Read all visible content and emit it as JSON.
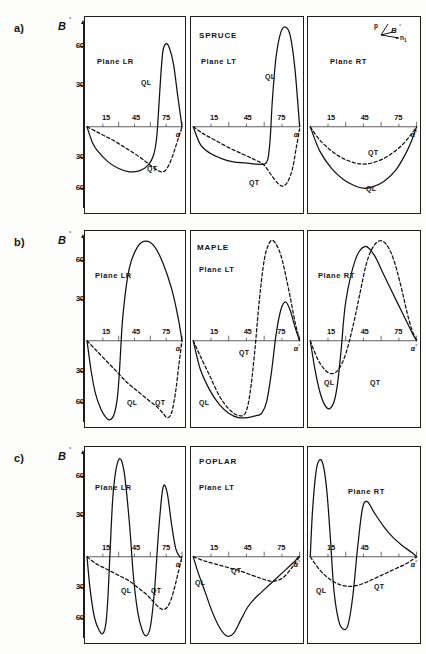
{
  "figure": {
    "axis": {
      "ylabel": "B",
      "ylabel_degree": "°",
      "yticks_positive": [
        "60",
        "30"
      ],
      "yticks_negative": [
        "30",
        "60"
      ],
      "xticks": [
        "15",
        "45",
        "75"
      ],
      "xlabel": "α",
      "xlabel_degree": "°"
    },
    "inset": {
      "p_label": "p",
      "beta_label": "B",
      "beta_degree": "°",
      "n_label": "n",
      "n_sub": "1"
    },
    "curve_labels": {
      "ql": "QL",
      "qt": "QT"
    },
    "rows": [
      {
        "tag": "a)",
        "species": "SPRUCE",
        "panels": [
          {
            "plane": "Plane LR",
            "ql_label": "QL",
            "qt_label": "QT"
          },
          {
            "plane": "Plane LT",
            "ql_label": "QL",
            "qt_label": "QT"
          },
          {
            "plane": "Plane RT",
            "ql_label": "QL",
            "qt_label": "QT"
          }
        ]
      },
      {
        "tag": "b)",
        "species": "MAPLE",
        "panels": [
          {
            "plane": "Plane  LR",
            "ql_label": "QL",
            "qt_label": "QT"
          },
          {
            "plane": "Plane LT",
            "ql_label": "QL",
            "qt_label": "QT"
          },
          {
            "plane": "Plane  RT",
            "ql_label": "QL",
            "qt_label": "QT"
          }
        ]
      },
      {
        "tag": "c)",
        "species": "POPLAR",
        "panels": [
          {
            "plane": "Plane    LR",
            "ql_label": "QL",
            "qt_label": "QT"
          },
          {
            "plane": "Plane  LT",
            "ql_label": "QL",
            "qt_label": "QT"
          },
          {
            "plane": "Plane  RT",
            "ql_label": "QL",
            "qt_label": "QT"
          }
        ]
      }
    ]
  },
  "chart_data": {
    "type": "line",
    "xlabel": "α°",
    "ylabel": "β°",
    "xlim": [
      0,
      90
    ],
    "ylim": [
      -75,
      75
    ],
    "xticks": [
      15,
      45,
      75
    ],
    "yticks": [
      -60,
      -30,
      0,
      30,
      60
    ],
    "grid": false,
    "legend": "inline curve labels QL (solid) and QT (dashed)",
    "series_styles": {
      "QL": "solid",
      "QT": "dashed"
    },
    "panels": [
      {
        "row": "a)",
        "species": "SPRUCE",
        "plane": "LR",
        "series": [
          {
            "name": "QL",
            "style": "solid",
            "x": [
              0,
              5,
              10,
              20,
              30,
              40,
              50,
              58,
              63,
              66,
              68,
              70,
              72,
              75,
              78,
              82,
              86,
              90
            ],
            "y": [
              0,
              -14,
              -22,
              -32,
              -38,
              -41,
              -40,
              -35,
              -26,
              -10,
              14,
              38,
              55,
              60,
              57,
              45,
              22,
              0
            ]
          },
          {
            "name": "QT",
            "style": "dashed",
            "x": [
              0,
              8,
              16,
              26,
              36,
              46,
              56,
              64,
              70,
              74,
              78,
              82,
              86,
              90
            ],
            "y": [
              0,
              -4,
              -8,
              -13,
              -19,
              -25,
              -32,
              -38,
              -41,
              -40,
              -34,
              -24,
              -12,
              0
            ]
          }
        ]
      },
      {
        "row": "a)",
        "species": "SPRUCE",
        "plane": "LT",
        "series": [
          {
            "name": "QL",
            "style": "solid",
            "x": [
              0,
              6,
              14,
              24,
              34,
              44,
              54,
              60,
              63,
              65,
              67,
              70,
              74,
              78,
              82,
              86,
              90
            ],
            "y": [
              0,
              -16,
              -24,
              -29,
              -32,
              -33,
              -34,
              -34,
              -30,
              -12,
              20,
              50,
              68,
              72,
              66,
              42,
              0
            ]
          },
          {
            "name": "QT",
            "style": "dashed",
            "x": [
              0,
              8,
              18,
              30,
              42,
              52,
              60,
              66,
              72,
              76,
              80,
              84,
              87,
              90
            ],
            "y": [
              0,
              -6,
              -12,
              -19,
              -25,
              -30,
              -35,
              -44,
              -52,
              -54,
              -50,
              -38,
              -20,
              -2
            ]
          }
        ]
      },
      {
        "row": "a)",
        "species": "SPRUCE",
        "plane": "RT",
        "series": [
          {
            "name": "QL",
            "style": "solid",
            "x": [
              0,
              8,
              18,
              28,
              38,
              45,
              52,
              62,
              72,
              80,
              86,
              90
            ],
            "y": [
              0,
              -22,
              -38,
              -48,
              -54,
              -56,
              -55,
              -50,
              -40,
              -26,
              -12,
              0
            ]
          },
          {
            "name": "QT",
            "style": "dashed",
            "x": [
              0,
              8,
              18,
              28,
              38,
              45,
              52,
              62,
              72,
              80,
              86,
              90
            ],
            "y": [
              0,
              -12,
              -22,
              -29,
              -33,
              -34,
              -33,
              -29,
              -22,
              -14,
              -6,
              0
            ]
          }
        ]
      },
      {
        "row": "b)",
        "species": "MAPLE",
        "plane": "LR",
        "series": [
          {
            "name": "QL",
            "style": "solid",
            "x": [
              0,
              4,
              8,
              13,
              18,
              22,
              26,
              29,
              31,
              34,
              40,
              48,
              56,
              64,
              72,
              80,
              86,
              90
            ],
            "y": [
              0,
              -28,
              -48,
              -62,
              -70,
              -72,
              -66,
              -50,
              -24,
              18,
              52,
              68,
              72,
              68,
              56,
              38,
              18,
              0
            ]
          },
          {
            "name": "QT",
            "style": "dashed",
            "x": [
              0,
              8,
              18,
              28,
              38,
              48,
              58,
              66,
              72,
              76,
              80,
              84,
              87,
              90
            ],
            "y": [
              0,
              -8,
              -18,
              -28,
              -38,
              -46,
              -54,
              -60,
              -66,
              -70,
              -66,
              -46,
              -22,
              0
            ]
          }
        ]
      },
      {
        "row": "b)",
        "species": "MAPLE",
        "plane": "LT",
        "series": [
          {
            "name": "QL",
            "style": "solid",
            "x": [
              0,
              6,
              14,
              22,
              30,
              38,
              46,
              54,
              58,
              62,
              66,
              70,
              74,
              78,
              82,
              86,
              90
            ],
            "y": [
              0,
              -26,
              -45,
              -58,
              -66,
              -70,
              -70,
              -68,
              -66,
              -56,
              -30,
              4,
              22,
              28,
              22,
              10,
              0
            ]
          },
          {
            "name": "QT",
            "style": "dashed",
            "x": [
              0,
              6,
              14,
              22,
              30,
              38,
              44,
              48,
              52,
              56,
              60,
              64,
              68,
              74,
              80,
              86,
              90
            ],
            "y": [
              0,
              -14,
              -32,
              -50,
              -62,
              -68,
              -66,
              -48,
              -10,
              30,
              58,
              70,
              72,
              62,
              40,
              14,
              0
            ]
          }
        ]
      },
      {
        "row": "b)",
        "species": "MAPLE",
        "plane": "RT",
        "series": [
          {
            "name": "QL",
            "style": "solid",
            "x": [
              0,
              4,
              8,
              12,
              16,
              20,
              23,
              26,
              30,
              38,
              46,
              54,
              62,
              70,
              78,
              86,
              90
            ],
            "y": [
              0,
              -26,
              -46,
              -58,
              -62,
              -56,
              -40,
              -10,
              28,
              58,
              68,
              62,
              48,
              34,
              20,
              6,
              0
            ]
          },
          {
            "name": "QT",
            "style": "dashed",
            "x": [
              0,
              6,
              12,
              18,
              24,
              30,
              36,
              42,
              47,
              52,
              58,
              64,
              70,
              76,
              82,
              86,
              90
            ],
            "y": [
              0,
              -16,
              -26,
              -30,
              -26,
              -12,
              10,
              34,
              54,
              66,
              72,
              70,
              60,
              42,
              20,
              8,
              0
            ]
          }
        ]
      },
      {
        "row": "c)",
        "species": "POPLAR",
        "plane": "LR",
        "series": [
          {
            "name": "QL",
            "style": "solid",
            "x": [
              0,
              3,
              7,
              11,
              15,
              18,
              20,
              22,
              25,
              30,
              35,
              40,
              44,
              48,
              52,
              56,
              60,
              64,
              68,
              72,
              76,
              80,
              84,
              88,
              90
            ],
            "y": [
              0,
              -30,
              -55,
              -66,
              -70,
              -60,
              -34,
              6,
              48,
              70,
              62,
              26,
              -18,
              -50,
              -66,
              -72,
              -64,
              -30,
              20,
              50,
              46,
              24,
              6,
              0,
              0
            ]
          },
          {
            "name": "QT",
            "style": "dashed",
            "x": [
              0,
              8,
              16,
              24,
              32,
              40,
              48,
              56,
              62,
              68,
              72,
              76,
              80,
              84,
              88,
              90
            ],
            "y": [
              0,
              -6,
              -10,
              -14,
              -18,
              -22,
              -28,
              -34,
              -40,
              -46,
              -48,
              -46,
              -38,
              -24,
              -8,
              0
            ]
          }
        ]
      },
      {
        "row": "c)",
        "species": "POPLAR",
        "plane": "LT",
        "series": [
          {
            "name": "QL",
            "style": "solid",
            "x": [
              0,
              4,
              10,
              16,
              22,
              28,
              34,
              40,
              46,
              52,
              58,
              64,
              70,
              76,
              82,
              86,
              89,
              90
            ],
            "y": [
              0,
              -14,
              -32,
              -50,
              -64,
              -72,
              -70,
              -58,
              -46,
              -38,
              -32,
              -26,
              -20,
              -14,
              -8,
              -4,
              0,
              0
            ]
          },
          {
            "name": "QT",
            "style": "dashed",
            "x": [
              0,
              10,
              20,
              30,
              40,
              50,
              58,
              64,
              70,
              76,
              82,
              86,
              90
            ],
            "y": [
              0,
              -4,
              -7,
              -10,
              -13,
              -17,
              -20,
              -22,
              -22,
              -19,
              -12,
              -6,
              0
            ]
          }
        ]
      },
      {
        "row": "c)",
        "species": "POPLAR",
        "plane": "RT",
        "series": [
          {
            "name": "QL",
            "style": "solid",
            "x": [
              0,
              2,
              5,
              8,
              11,
              14,
              17,
              20,
              24,
              28,
              32,
              36,
              40,
              44,
              48,
              54,
              62,
              70,
              78,
              86,
              90
            ],
            "y": [
              0,
              34,
              62,
              70,
              66,
              48,
              14,
              -30,
              -58,
              -66,
              -62,
              -36,
              6,
              34,
              40,
              32,
              22,
              14,
              8,
              3,
              0
            ]
          },
          {
            "name": "QT",
            "style": "dashed",
            "x": [
              0,
              8,
              16,
              24,
              32,
              40,
              48,
              56,
              64,
              72,
              80,
              86,
              90
            ],
            "y": [
              0,
              -12,
              -20,
              -25,
              -27,
              -26,
              -23,
              -19,
              -15,
              -11,
              -7,
              -3,
              0
            ]
          }
        ]
      }
    ]
  }
}
